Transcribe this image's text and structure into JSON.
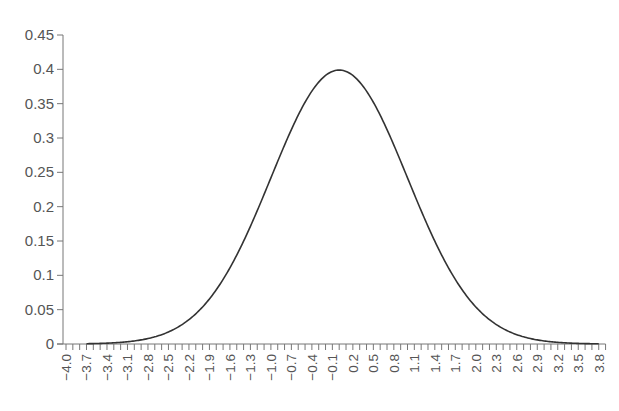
{
  "chart_data": {
    "type": "line",
    "title": "",
    "xlabel": "",
    "ylabel": "",
    "xlim": [
      -4.0,
      3.9
    ],
    "ylim": [
      0,
      0.45
    ],
    "grid": false,
    "legend": null,
    "y_ticks": [
      0,
      0.05,
      0.1,
      0.15,
      0.2,
      0.25,
      0.3,
      0.35,
      0.4,
      0.45
    ],
    "y_tick_labels": [
      "0",
      "0.05",
      "0.1",
      "0.15",
      "0.2",
      "0.25",
      "0.3",
      "0.35",
      "0.4",
      "0.45"
    ],
    "x_tick_step": 0.1,
    "x_tick_labels": [
      "-4.0",
      "-3.7",
      "-3.4",
      "-3.1",
      "-2.8",
      "-2.5",
      "-2.2",
      "-1.9",
      "-1.6",
      "-1.3",
      "-1.0",
      "-0.7",
      "-0.4",
      "-0.1",
      "0.2",
      "0.5",
      "0.8",
      "1.1",
      "1.4",
      "1.7",
      "2.0",
      "2.3",
      "2.6",
      "2.9",
      "3.2",
      "3.5",
      "3.8"
    ],
    "series": [
      {
        "name": "Standard normal density",
        "color": "#333333",
        "x": [
          -4.0,
          -3.5,
          -3.0,
          -2.5,
          -2.0,
          -1.5,
          -1.0,
          -0.5,
          0.0,
          0.5,
          1.0,
          1.5,
          2.0,
          2.5,
          3.0,
          3.5,
          3.8
        ],
        "y": [
          0.0001,
          0.0009,
          0.0044,
          0.0175,
          0.054,
          0.1295,
          0.242,
          0.3521,
          0.3989,
          0.3521,
          0.242,
          0.1295,
          0.054,
          0.0175,
          0.0044,
          0.0009,
          0.0003
        ]
      }
    ]
  },
  "colors": {
    "axis": "#777777",
    "line": "#333333",
    "text": "#555555"
  }
}
